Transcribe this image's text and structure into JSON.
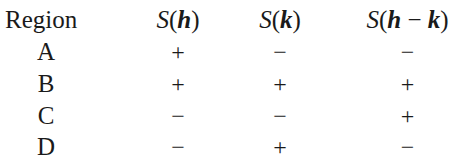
{
  "table": {
    "headers": [
      {
        "label": "Region"
      },
      {
        "func": "S",
        "arg": "h",
        "display": "S(h)"
      },
      {
        "func": "S",
        "arg": "k",
        "display": "S(k)"
      },
      {
        "func": "S",
        "arg": "h − k",
        "display": "S(h − k)"
      }
    ],
    "header_parts": {
      "region": "Region",
      "s": "S",
      "open": "(",
      "close": ")",
      "h": "h",
      "k": "k",
      "minus": " − "
    },
    "rows": [
      {
        "region": "A",
        "S_h": "+",
        "S_k": "−",
        "S_h_minus_k": "−"
      },
      {
        "region": "B",
        "S_h": "+",
        "S_k": "+",
        "S_h_minus_k": "+"
      },
      {
        "region": "C",
        "S_h": "−",
        "S_k": "−",
        "S_h_minus_k": "+"
      },
      {
        "region": "D",
        "S_h": "−",
        "S_k": "+",
        "S_h_minus_k": "−"
      }
    ]
  }
}
